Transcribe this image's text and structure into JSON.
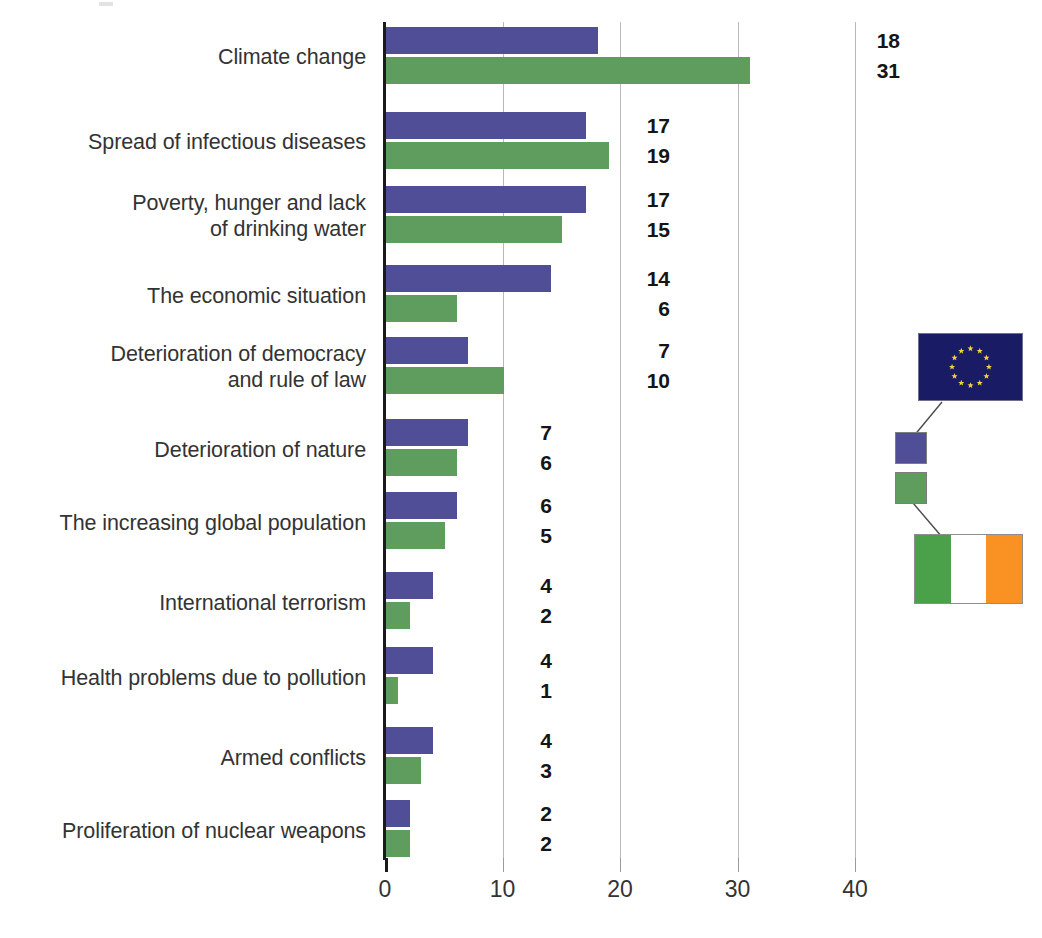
{
  "chart_data": {
    "type": "bar",
    "orientation": "horizontal",
    "title": "",
    "subtitle": "",
    "xlabel": "",
    "ylabel": "",
    "xlim": [
      0,
      44
    ],
    "xticks": [
      0,
      10,
      20,
      30,
      40
    ],
    "xtick_labels": [
      "0",
      "10",
      "20",
      "30",
      "40"
    ],
    "grid": true,
    "grid_axis": "x",
    "legend_position": "right",
    "categories": [
      "Climate change",
      "Spread of infectious diseases",
      "Poverty, hunger and lack\nof drinking water",
      "The economic situation",
      "Deterioration of democracy\nand rule of law",
      "Deterioration of nature",
      "The increasing global population",
      "International terrorism",
      "Health problems due to pollution",
      "Armed conflicts",
      "Proliferation of nuclear weapons"
    ],
    "series": [
      {
        "name": "EU",
        "color": "#4f4e97",
        "flag": "eu-flag",
        "values": [
          18,
          17,
          17,
          14,
          7,
          7,
          6,
          4,
          4,
          4,
          2
        ]
      },
      {
        "name": "Ireland",
        "color": "#5f9d5e",
        "flag": "ireland-flag",
        "values": [
          31,
          19,
          15,
          6,
          10,
          6,
          5,
          2,
          1,
          3,
          2
        ]
      }
    ]
  },
  "rows": [
    {
      "label_line1": "Climate change",
      "label_line2": "",
      "eu": "18",
      "ie": "31",
      "eu_v": 18,
      "ie_v": 31,
      "label_top": 44,
      "bars_top": 27,
      "vals_left": 866
    },
    {
      "label_line1": "Spread of infectious diseases",
      "label_line2": "",
      "eu": "17",
      "ie": "19",
      "eu_v": 17,
      "ie_v": 19,
      "label_top": 129,
      "bars_top": 112,
      "vals_left": 636
    },
    {
      "label_line1": "Poverty, hunger and lack",
      "label_line2": "of drinking water",
      "eu": "17",
      "ie": "15",
      "eu_v": 17,
      "ie_v": 15,
      "label_top": 190,
      "bars_top": 186,
      "vals_left": 636
    },
    {
      "label_line1": "The economic situation",
      "label_line2": "",
      "eu": "14",
      "ie": "6",
      "eu_v": 14,
      "ie_v": 6,
      "label_top": 283,
      "bars_top": 265,
      "vals_left": 636
    },
    {
      "label_line1": "Deterioration of democracy",
      "label_line2": "and rule of law",
      "eu": "7",
      "ie": "10",
      "eu_v": 7,
      "ie_v": 10,
      "label_top": 341,
      "bars_top": 337,
      "vals_left": 636
    },
    {
      "label_line1": "Deterioration of nature",
      "label_line2": "",
      "eu": "7",
      "ie": "6",
      "eu_v": 7,
      "ie_v": 6,
      "label_top": 437,
      "bars_top": 419,
      "vals_left": 518
    },
    {
      "label_line1": "The increasing global population",
      "label_line2": "",
      "eu": "6",
      "ie": "5",
      "eu_v": 6,
      "ie_v": 5,
      "label_top": 510,
      "bars_top": 492,
      "vals_left": 518
    },
    {
      "label_line1": "International terrorism",
      "label_line2": "",
      "eu": "4",
      "ie": "2",
      "eu_v": 4,
      "ie_v": 2,
      "label_top": 590,
      "bars_top": 572,
      "vals_left": 518
    },
    {
      "label_line1": "Health problems due to pollution",
      "label_line2": "",
      "eu": "4",
      "ie": "1",
      "eu_v": 4,
      "ie_v": 1,
      "label_top": 665,
      "bars_top": 647,
      "vals_left": 518
    },
    {
      "label_line1": "Armed conflicts",
      "label_line2": "",
      "eu": "4",
      "ie": "3",
      "eu_v": 4,
      "ie_v": 3,
      "label_top": 745,
      "bars_top": 727,
      "vals_left": 518
    },
    {
      "label_line1": "Proliferation of nuclear weapons",
      "label_line2": "",
      "eu": "2",
      "ie": "2",
      "eu_v": 2,
      "ie_v": 2,
      "label_top": 818,
      "bars_top": 800,
      "vals_left": 518
    }
  ],
  "axis": {
    "ticks": [
      {
        "label": "0",
        "value": 0
      },
      {
        "label": "10",
        "value": 10
      },
      {
        "label": "20",
        "value": 20
      },
      {
        "label": "30",
        "value": 30
      },
      {
        "label": "40",
        "value": 40
      }
    ]
  },
  "legend": {
    "eu_flag_name": "European Union flag",
    "eu_series_color": "#4f4e97",
    "ireland_flag_name": "Ireland flag",
    "ireland_series_color": "#5f9d5e",
    "ireland_colors": {
      "green": "#4aa14a",
      "white": "#ffffff",
      "orange": "#f99123"
    },
    "eu_flag_colors": {
      "field": "#191b64",
      "star": "#f5d33c"
    }
  }
}
